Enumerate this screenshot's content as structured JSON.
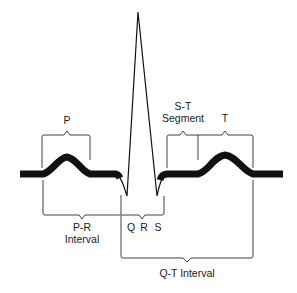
{
  "diagram": {
    "colors": {
      "trace": "#111111",
      "bracket": "#2a2a2a",
      "text": "#1a1a1a",
      "background": "#ffffff"
    },
    "labels": {
      "p_wave": "P",
      "st_segment_line1": "S-T",
      "st_segment_line2": "Segment",
      "t_wave": "T",
      "pr_interval_line1": "P-R",
      "pr_interval_line2": "Interval",
      "q": "Q",
      "r": "R",
      "s": "S",
      "qt_interval": "Q-T Interval"
    },
    "nodes": [
      {
        "id": "p_wave",
        "label": "P"
      },
      {
        "id": "qrs_complex",
        "label": "Q R S"
      },
      {
        "id": "st_segment",
        "label": "S-T Segment"
      },
      {
        "id": "t_wave",
        "label": "T"
      },
      {
        "id": "pr_interval",
        "label": "P-R Interval"
      },
      {
        "id": "qt_interval",
        "label": "Q-T Interval"
      }
    ],
    "edges": [
      {
        "from": "p_wave",
        "to": "qrs_complex",
        "relation": "P-R Interval spans P onset to Q"
      },
      {
        "from": "qrs_complex",
        "to": "st_segment",
        "relation": "follows"
      },
      {
        "from": "st_segment",
        "to": "t_wave",
        "relation": "follows"
      },
      {
        "from": "qrs_complex",
        "to": "t_wave",
        "relation": "Q-T Interval spans Q to end of T"
      }
    ]
  }
}
